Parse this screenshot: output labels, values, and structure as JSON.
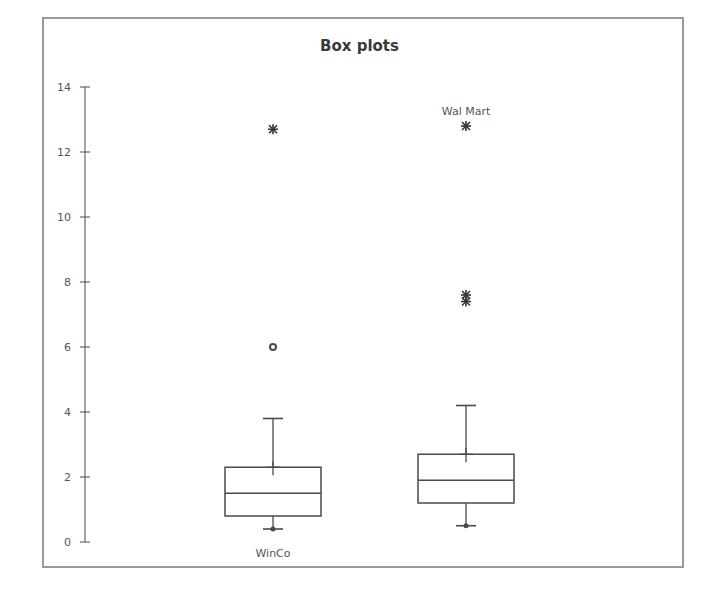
{
  "chart_data": {
    "type": "box",
    "title": "Box plots",
    "xlabel": "",
    "ylabel": "",
    "ylim": [
      0,
      14
    ],
    "yticks": [
      0,
      2,
      4,
      6,
      8,
      10,
      12,
      14
    ],
    "grid": false,
    "legend": null,
    "categories": [
      "WinCo",
      "Wal Mart"
    ],
    "series": [
      {
        "name": "WinCo",
        "label_position": "below",
        "whisker_low": 0.4,
        "q1": 0.8,
        "median": 1.5,
        "q3": 2.3,
        "whisker_high": 3.8,
        "mean": 2.3,
        "outliers": [
          {
            "value": 6.0,
            "marker": "circle"
          },
          {
            "value": 12.7,
            "marker": "star"
          }
        ]
      },
      {
        "name": "Wal Mart",
        "label_position": "above",
        "whisker_low": 0.5,
        "q1": 1.2,
        "median": 1.9,
        "q3": 2.7,
        "whisker_high": 4.2,
        "mean": 2.7,
        "outliers": [
          {
            "value": 7.4,
            "marker": "star"
          },
          {
            "value": 7.6,
            "marker": "star"
          },
          {
            "value": 12.8,
            "marker": "star"
          }
        ]
      }
    ]
  },
  "colors": {
    "line": "#4a4a4a",
    "frame": "#9a9a9a",
    "text": "#555555"
  }
}
